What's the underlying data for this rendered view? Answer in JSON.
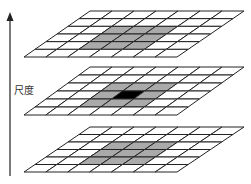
{
  "axis": {
    "label": "尺度",
    "direction": "up"
  },
  "colors": {
    "line": "#222222",
    "neighbor": "#aaaaaa",
    "center": "#000000",
    "empty": "#ffffff"
  },
  "grids": [
    {
      "name": "upper-scale",
      "rows": 6,
      "cols": 7,
      "highlight": {
        "rows": [
          2,
          3,
          4
        ],
        "cols": [
          2,
          3,
          4
        ]
      },
      "center": null
    },
    {
      "name": "current-scale",
      "rows": 6,
      "cols": 7,
      "highlight": {
        "rows": [
          2,
          3,
          4
        ],
        "cols": [
          2,
          3,
          4
        ]
      },
      "center": {
        "row": 3,
        "col": 3
      }
    },
    {
      "name": "lower-scale",
      "rows": 6,
      "cols": 7,
      "highlight": {
        "rows": [
          2,
          3,
          4
        ],
        "cols": [
          2,
          3,
          4
        ]
      },
      "center": null
    }
  ]
}
